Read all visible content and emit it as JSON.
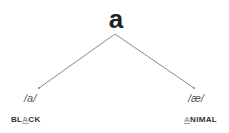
{
  "root": {
    "letter": "a"
  },
  "branches": [
    {
      "phoneme": "/a/",
      "word_pre": "BL",
      "word_hl": "A",
      "word_post": "CK"
    },
    {
      "phoneme": "/æ/",
      "word_pre": "",
      "word_hl": "A",
      "word_post": "NIMAL"
    }
  ],
  "colors": {
    "line": "#8a8a8a",
    "text": "#333333"
  }
}
